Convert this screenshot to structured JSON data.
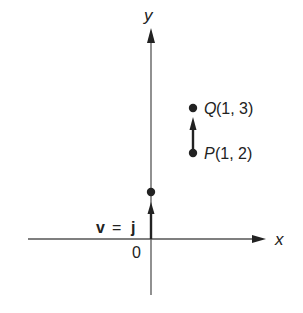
{
  "diagram": {
    "axes": {
      "x_label": "x",
      "y_label": "y",
      "origin_label": "0"
    },
    "vector_j": {
      "label_v": "v",
      "label_eq": "=",
      "label_j": "j",
      "from": [
        0,
        0
      ],
      "to": [
        0,
        1
      ]
    },
    "vector_PQ": {
      "P": {
        "name": "P",
        "coords": "(1, 2)"
      },
      "Q": {
        "name": "Q",
        "coords": "(1, 3)"
      }
    },
    "colors": {
      "ink": "#222222",
      "background": "#ffffff"
    }
  }
}
